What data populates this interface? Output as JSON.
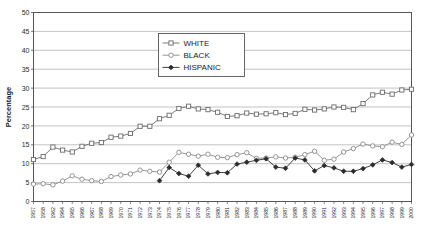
{
  "chart_data": {
    "type": "line",
    "title": "",
    "xlabel": "",
    "ylabel": "Percentage",
    "ylim": [
      0,
      50
    ],
    "ytick_step": 5,
    "yticks": [
      0,
      5,
      10,
      15,
      20,
      25,
      30,
      35,
      40,
      45,
      50
    ],
    "grid": true,
    "grid_axis": "y",
    "legend_position": "upper-center",
    "categories": [
      "1957",
      "1958",
      "1962",
      "1964",
      "1965",
      "1966",
      "1967",
      "1968",
      "1969",
      "1970",
      "1971",
      "1972",
      "1973",
      "1974",
      "1975",
      "1976",
      "1977",
      "1978",
      "1979",
      "1980",
      "1981",
      "1982",
      "1983",
      "1984",
      "1985",
      "1986",
      "1987",
      "1988",
      "1989",
      "1990",
      "1991",
      "1992",
      "1993",
      "1994",
      "1995",
      "1996",
      "1997",
      "1998",
      "1999",
      "2000"
    ],
    "series": [
      {
        "name": "WHITE",
        "marker": "open-square",
        "color": "#6b6b6b",
        "values": [
          11.1,
          11.9,
          14.4,
          13.6,
          13.1,
          14.6,
          15.4,
          15.6,
          17.0,
          17.3,
          18.0,
          19.9,
          19.9,
          21.9,
          22.8,
          24.6,
          25.2,
          24.5,
          24.3,
          23.6,
          22.5,
          22.7,
          23.4,
          23.1,
          23.2,
          23.5,
          23.0,
          23.3,
          24.4,
          24.2,
          24.5,
          25.0,
          24.9,
          24.3,
          25.9,
          28.2,
          28.9,
          28.4,
          29.5,
          29.7
        ]
      },
      {
        "name": "BLACK",
        "marker": "open-circle",
        "color": "#8a8a8a",
        "values": [
          4.6,
          4.7,
          4.4,
          5.4,
          6.8,
          5.9,
          5.5,
          5.3,
          6.6,
          7.0,
          7.3,
          8.3,
          8.0,
          7.8,
          10.4,
          13.0,
          12.5,
          12.0,
          12.5,
          11.7,
          11.6,
          12.4,
          12.9,
          11.4,
          11.5,
          11.8,
          11.5,
          11.7,
          12.4,
          13.3,
          10.9,
          11.2,
          13.1,
          14.0,
          15.2,
          14.7,
          14.5,
          15.7,
          15.1,
          17.6
        ]
      },
      {
        "name": "HISPANIC",
        "marker": "filled-diamond",
        "color": "#2b2b2b",
        "start_index": 13,
        "values": [
          null,
          null,
          null,
          null,
          null,
          null,
          null,
          null,
          null,
          null,
          null,
          null,
          null,
          5.5,
          9.0,
          7.4,
          6.7,
          9.6,
          7.3,
          7.7,
          7.6,
          9.9,
          10.4,
          10.9,
          11.3,
          9.1,
          8.8,
          11.5,
          11.0,
          8.1,
          9.5,
          8.9,
          8.0,
          8.0,
          8.7,
          9.7,
          11.0,
          10.3,
          9.1,
          9.8
        ]
      }
    ]
  },
  "legend": {
    "items": [
      {
        "label": "WHITE"
      },
      {
        "label": "BLACK"
      },
      {
        "label": "HISPANIC"
      }
    ]
  },
  "axis": {
    "y_title": "Percentage"
  }
}
